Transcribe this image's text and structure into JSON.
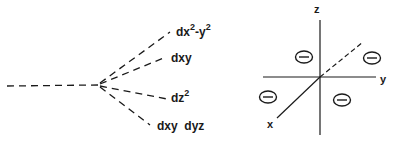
{
  "splitting_diagram": {
    "title": "d-orbital splitting",
    "levels": [
      {
        "id": "dx2-y2",
        "base": "dx",
        "sup1": "2",
        "mid": "-y",
        "sup2": "2"
      },
      {
        "id": "dxy",
        "label": "dxy"
      },
      {
        "id": "dz2",
        "base": "dz",
        "sup1": "2"
      },
      {
        "id": "dxy-dyz",
        "label": "dxy  dyz"
      }
    ]
  },
  "axes_diagram": {
    "axes": {
      "x": "x",
      "y": "y",
      "z": "z"
    },
    "charges": [
      {
        "symbol": "−",
        "position": "upper-left"
      },
      {
        "symbol": "−",
        "position": "upper-right"
      },
      {
        "symbol": "−",
        "position": "lower-left"
      },
      {
        "symbol": "−",
        "position": "lower-right"
      }
    ]
  },
  "colors": {
    "line": "#1a1a1a",
    "background": "#ffffff"
  }
}
